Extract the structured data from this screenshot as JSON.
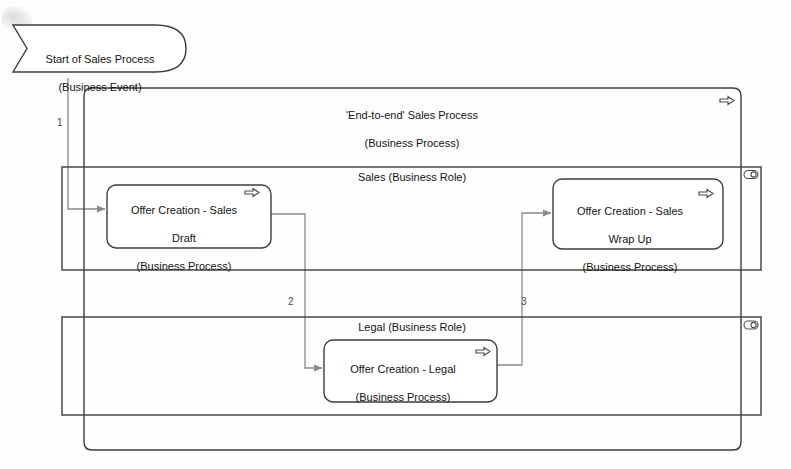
{
  "diagram": {
    "stroke_color": "#3c3c3c",
    "connector_color": "#8a8a8a",
    "fill_color": "#ffffff",
    "text_color": "#141414"
  },
  "start_event": {
    "label": "Start of Sales Process\n(Business Event)",
    "name_line": "Start of Sales Process",
    "type_line": "(Business Event)",
    "icon": "business-event-icon"
  },
  "end_to_end_process": {
    "label": "'End-to-end' Sales Process\n(Business Process)",
    "name_line": "'End-to-end' Sales Process",
    "type_line": "(Business Process)",
    "icon": "business-process-arrow-icon"
  },
  "roles": [
    {
      "label": "Sales (Business Role)",
      "name_line": "Sales",
      "type_line": "(Business Role)",
      "icon": "business-role-icon"
    },
    {
      "label": "Legal (Business Role)",
      "name_line": "Legal",
      "type_line": "(Business Role)",
      "icon": "business-role-icon"
    }
  ],
  "processes": [
    {
      "label": "Offer Creation - Sales Draft\n(Business Process)",
      "line1": "Offer Creation - Sales",
      "line2": "Draft",
      "line3": "(Business Process)",
      "icon": "business-process-arrow-icon",
      "role": "Sales"
    },
    {
      "label": "Offer Creation - Sales Wrap Up\n(Business Process)",
      "line1": "Offer Creation - Sales",
      "line2": "Wrap Up",
      "line3": "(Business Process)",
      "icon": "business-process-arrow-icon",
      "role": "Sales"
    },
    {
      "label": "Offer Creation - Legal\n(Business Process)",
      "line1": "Offer Creation - Legal",
      "line2": "(Business Process)",
      "icon": "business-process-arrow-icon",
      "role": "Legal"
    }
  ],
  "connectors": [
    {
      "number": "1",
      "from": "Start of Sales Process",
      "to": "Offer Creation - Sales Draft"
    },
    {
      "number": "2",
      "from": "Offer Creation - Sales Draft",
      "to": "Offer Creation - Legal"
    },
    {
      "number": "3",
      "from": "Offer Creation - Legal",
      "to": "Offer Creation - Sales Wrap Up"
    }
  ]
}
